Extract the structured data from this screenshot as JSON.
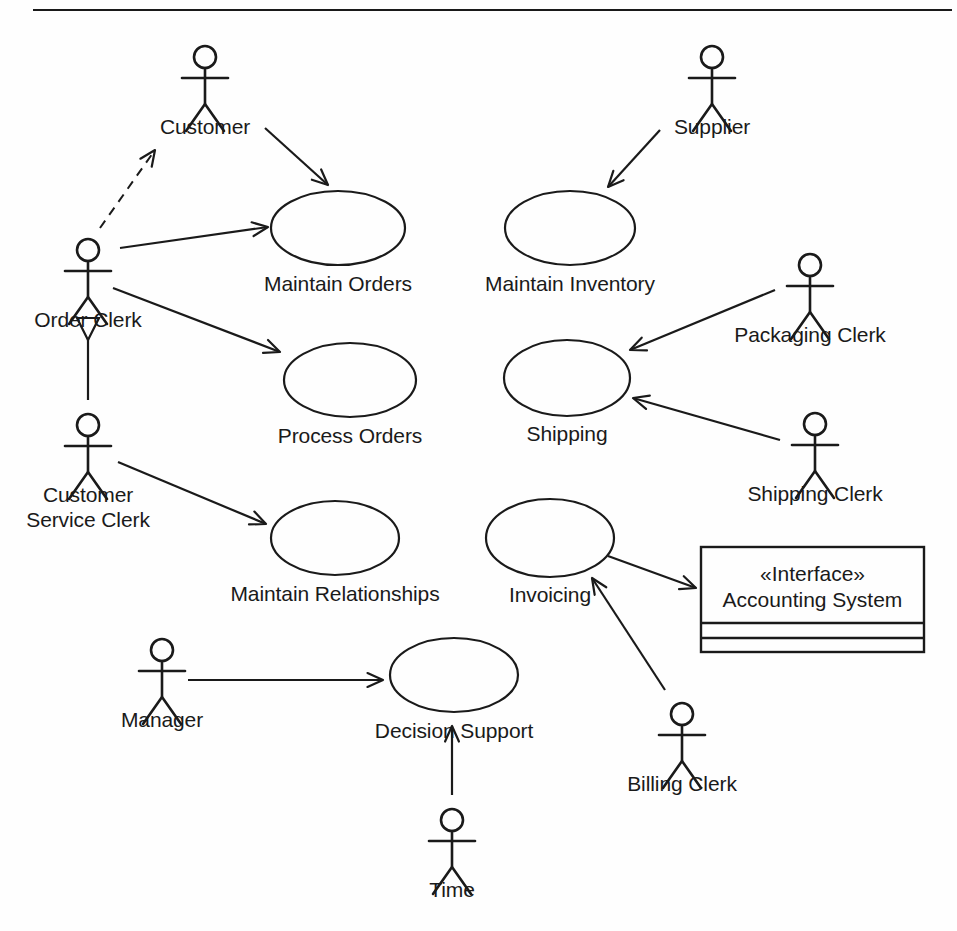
{
  "diagram": {
    "kind": "uml-use-case-diagram",
    "top_rule": {
      "x1": 33,
      "y1": 10,
      "x2": 952,
      "y2": 10
    },
    "actors": [
      {
        "id": "customer",
        "label": "Customer",
        "label_lines": [
          "Customer"
        ],
        "head_cx": 205,
        "head_cy": 57,
        "label_x": 205,
        "label_y": 114
      },
      {
        "id": "supplier",
        "label": "Supplier",
        "label_lines": [
          "Supplier"
        ],
        "head_cx": 712,
        "head_cy": 57,
        "label_x": 712,
        "label_y": 114
      },
      {
        "id": "order-clerk",
        "label": "Order Clerk",
        "label_lines": [
          "Order Clerk"
        ],
        "head_cx": 88,
        "head_cy": 250,
        "label_x": 88,
        "label_y": 307
      },
      {
        "id": "customer-service-clerk",
        "label": "Customer Service Clerk",
        "label_lines": [
          "Customer",
          "Service Clerk"
        ],
        "head_cx": 88,
        "head_cy": 425,
        "label_x": 88,
        "label_y": 482
      },
      {
        "id": "packaging-clerk",
        "label": "Packaging Clerk",
        "label_lines": [
          "Packaging Clerk"
        ],
        "head_cx": 810,
        "head_cy": 265,
        "label_x": 810,
        "label_y": 322
      },
      {
        "id": "shipping-clerk",
        "label": "Shipping Clerk",
        "label_lines": [
          "Shipping Clerk"
        ],
        "head_cx": 815,
        "head_cy": 424,
        "label_x": 815,
        "label_y": 481
      },
      {
        "id": "billing-clerk",
        "label": "Billing Clerk",
        "label_lines": [
          "Billing Clerk"
        ],
        "head_cx": 682,
        "head_cy": 714,
        "label_x": 682,
        "label_y": 771
      },
      {
        "id": "manager",
        "label": "Manager",
        "label_lines": [
          "Manager"
        ],
        "head_cx": 162,
        "head_cy": 650,
        "label_x": 162,
        "label_y": 707
      },
      {
        "id": "time",
        "label": "Time",
        "label_lines": [
          "Time"
        ],
        "head_cx": 452,
        "head_cy": 820,
        "label_x": 452,
        "label_y": 877
      }
    ],
    "use_cases": [
      {
        "id": "maintain-orders",
        "label": "Maintain Orders",
        "cx": 338,
        "cy": 228,
        "rx": 67,
        "ry": 37,
        "label_x": 338,
        "label_y": 271
      },
      {
        "id": "maintain-inventory",
        "label": "Maintain Inventory",
        "cx": 570,
        "cy": 228,
        "rx": 65,
        "ry": 37,
        "label_x": 570,
        "label_y": 271
      },
      {
        "id": "process-orders",
        "label": "Process Orders",
        "cx": 350,
        "cy": 380,
        "rx": 66,
        "ry": 37,
        "label_x": 350,
        "label_y": 423
      },
      {
        "id": "shipping",
        "label": "Shipping",
        "cx": 567,
        "cy": 378,
        "rx": 63,
        "ry": 38,
        "label_x": 567,
        "label_y": 421
      },
      {
        "id": "maintain-relationships",
        "label": "Maintain Relationships",
        "cx": 335,
        "cy": 538,
        "rx": 64,
        "ry": 37,
        "label_x": 335,
        "label_y": 581
      },
      {
        "id": "invoicing",
        "label": "Invoicing",
        "cx": 550,
        "cy": 538,
        "rx": 64,
        "ry": 39,
        "label_x": 550,
        "label_y": 582
      },
      {
        "id": "decision-support",
        "label": "Decision Support",
        "cx": 454,
        "cy": 675,
        "rx": 64,
        "ry": 37,
        "label_x": 454,
        "label_y": 718
      }
    ],
    "interface_box": {
      "id": "accounting-system",
      "stereotype": "«Interface»",
      "name": "Accounting System",
      "x": 701,
      "y": 547,
      "width": 223,
      "height": 105,
      "divider1_y": 623,
      "divider2_y": 638
    },
    "associations": [
      {
        "id": "customer-to-maintain-orders",
        "from": "customer",
        "to": "maintain-orders",
        "x1": 265,
        "y1": 128,
        "x2": 328,
        "y2": 185,
        "arrow": "open",
        "style": "solid"
      },
      {
        "id": "supplier-to-maintain-inventory",
        "from": "supplier",
        "to": "maintain-inventory",
        "x1": 660,
        "y1": 130,
        "x2": 608,
        "y2": 187,
        "arrow": "open",
        "style": "solid"
      },
      {
        "id": "order-clerk-to-customer",
        "from": "order-clerk",
        "to": "customer",
        "x1": 100,
        "y1": 228,
        "x2": 155,
        "y2": 150,
        "arrow": "open",
        "style": "dashed"
      },
      {
        "id": "order-clerk-to-maintain-orders",
        "from": "order-clerk",
        "to": "maintain-orders",
        "x1": 120,
        "y1": 248,
        "x2": 268,
        "y2": 227,
        "arrow": "open",
        "style": "solid"
      },
      {
        "id": "order-clerk-to-process-orders",
        "from": "order-clerk",
        "to": "process-orders",
        "x1": 113,
        "y1": 288,
        "x2": 280,
        "y2": 352,
        "arrow": "open",
        "style": "solid"
      },
      {
        "id": "customer-service-clerk-to-order-clerk",
        "from": "customer-service-clerk",
        "to": "order-clerk",
        "x1": 88,
        "y1": 400,
        "x2": 88,
        "y2": 340,
        "arrow": "generalization",
        "style": "solid"
      },
      {
        "id": "customer-service-clerk-to-maintain-rel",
        "from": "customer-service-clerk",
        "to": "maintain-relationships",
        "x1": 118,
        "y1": 462,
        "x2": 266,
        "y2": 524,
        "arrow": "open",
        "style": "solid"
      },
      {
        "id": "packaging-clerk-to-shipping",
        "from": "packaging-clerk",
        "to": "shipping",
        "x1": 775,
        "y1": 290,
        "x2": 630,
        "y2": 350,
        "arrow": "open",
        "style": "solid"
      },
      {
        "id": "shipping-clerk-to-shipping",
        "from": "shipping-clerk",
        "to": "shipping",
        "x1": 780,
        "y1": 440,
        "x2": 633,
        "y2": 398,
        "arrow": "open",
        "style": "solid"
      },
      {
        "id": "invoicing-to-accounting-system",
        "from": "invoicing",
        "to": "accounting-system",
        "x1": 608,
        "y1": 556,
        "x2": 696,
        "y2": 588,
        "arrow": "open",
        "style": "solid"
      },
      {
        "id": "billing-clerk-to-invoicing",
        "from": "billing-clerk",
        "to": "invoicing",
        "x1": 665,
        "y1": 690,
        "x2": 592,
        "y2": 578,
        "arrow": "open",
        "style": "solid"
      },
      {
        "id": "manager-to-decision-support",
        "from": "manager",
        "to": "decision-support",
        "x1": 188,
        "y1": 680,
        "x2": 383,
        "y2": 680,
        "arrow": "open",
        "style": "solid"
      },
      {
        "id": "time-to-decision-support",
        "from": "time",
        "to": "decision-support",
        "x1": 452,
        "y1": 795,
        "x2": 452,
        "y2": 726,
        "arrow": "open",
        "style": "solid"
      }
    ]
  }
}
